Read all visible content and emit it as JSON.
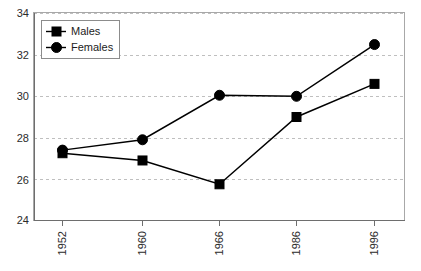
{
  "chart_data": {
    "type": "line",
    "title": "",
    "subtitle": "",
    "xlabel": "",
    "ylabel": "",
    "categories": [
      "1952",
      "1960",
      "1966",
      "1986",
      "1996"
    ],
    "series": [
      {
        "name": "Males",
        "marker": "square",
        "color": "#000000",
        "values": [
          27.25,
          26.9,
          25.75,
          29.0,
          30.6
        ]
      },
      {
        "name": "Females",
        "marker": "circle",
        "color": "#000000",
        "values": [
          27.4,
          27.9,
          30.05,
          30.0,
          32.5
        ]
      }
    ],
    "ylim": [
      24,
      34
    ],
    "yticks": [
      24,
      26,
      28,
      30,
      32,
      34
    ],
    "ytick_labels": [
      "24",
      "26",
      "28",
      "30",
      "32",
      "34"
    ],
    "xtick_labels": [
      "1952",
      "1960",
      "1966",
      "1986",
      "1996"
    ],
    "xtick_rotation": -90,
    "grid": true,
    "grid_axis": "y",
    "grid_color": "#bfbfbf",
    "legend": {
      "position": "top-left",
      "entries": [
        "Males",
        "Females"
      ]
    },
    "plot_background": "#ffffff",
    "frame_color": "#a8a8a8"
  },
  "legend": {
    "males_label": "Males",
    "females_label": "Females"
  },
  "axes": {
    "y": {
      "t0": "24",
      "t1": "26",
      "t2": "28",
      "t3": "30",
      "t4": "32",
      "t5": "34"
    },
    "x": {
      "c0": "1952",
      "c1": "1960",
      "c2": "1966",
      "c3": "1986",
      "c4": "1996"
    }
  }
}
